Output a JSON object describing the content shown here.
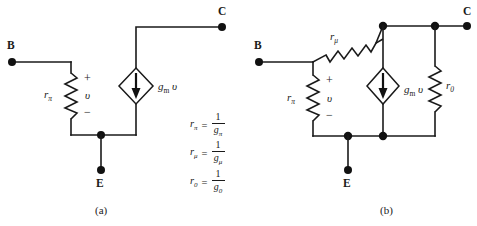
{
  "figure": {
    "background_color": "#ffffff",
    "line_color": "#1a1a1a"
  },
  "circuit_a": {
    "caption": "(a)",
    "terminals": {
      "base": "B",
      "collector": "C",
      "emitter": "E"
    },
    "resistor_rpi": {
      "label_r": "r",
      "label_sub": "π"
    },
    "voltage": {
      "plus": "+",
      "symbol": "υ",
      "minus": "−"
    },
    "source": {
      "label_g": "g",
      "label_sub": "m",
      "label_v": "υ",
      "arrow_direction": "down",
      "shape": "diamond"
    }
  },
  "circuit_b": {
    "caption": "(b)",
    "terminals": {
      "base": "B",
      "collector": "C",
      "emitter": "E"
    },
    "resistor_rpi": {
      "label_r": "r",
      "label_sub": "π"
    },
    "resistor_rmu": {
      "label_r": "r",
      "label_sub": "μ"
    },
    "resistor_r0": {
      "label_r": "r",
      "label_sub": "0"
    },
    "voltage": {
      "plus": "+",
      "symbol": "υ",
      "minus": "−"
    },
    "source": {
      "label_g": "g",
      "label_sub": "m",
      "label_v": "υ",
      "arrow_direction": "down",
      "shape": "diamond"
    }
  },
  "equations": [
    {
      "lhs_r": "r",
      "lhs_sub": "π",
      "equals": "=",
      "numerator": "1",
      "denominator_g": "g",
      "denominator_sub": "π"
    },
    {
      "lhs_r": "r",
      "lhs_sub": "μ",
      "equals": "=",
      "numerator": "1",
      "denominator_g": "g",
      "denominator_sub": "μ"
    },
    {
      "lhs_r": "r",
      "lhs_sub": "0",
      "equals": "=",
      "numerator": "1",
      "denominator_g": "g",
      "denominator_sub": "0"
    }
  ]
}
